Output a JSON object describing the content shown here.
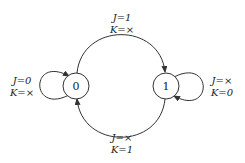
{
  "diagram": {
    "type": "state-transition-diagram",
    "states": [
      {
        "id": "s0",
        "label": "0"
      },
      {
        "id": "s1",
        "label": "1"
      }
    ],
    "transitions": [
      {
        "from": "0",
        "to": "0",
        "label_line1": "J=0",
        "label_line2": "K=×"
      },
      {
        "from": "0",
        "to": "1",
        "label_line1": "J=1",
        "label_line2": "K=×"
      },
      {
        "from": "1",
        "to": "1",
        "label_line1": "J=×",
        "label_line2": "K=0"
      },
      {
        "from": "1",
        "to": "0",
        "label_line1": "J=×",
        "label_line2": "K=1"
      }
    ]
  },
  "colors": {
    "stroke": "#333333",
    "background": "#ffffff"
  }
}
